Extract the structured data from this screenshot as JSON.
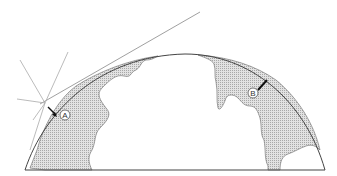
{
  "diagram": {
    "labels": {
      "a": "A",
      "b": "B"
    },
    "colors": {
      "stroke": "#555555",
      "land_fill": "#d4d4d4",
      "ray": "#999999",
      "arrow": "#111111",
      "background": "#ffffff"
    }
  }
}
